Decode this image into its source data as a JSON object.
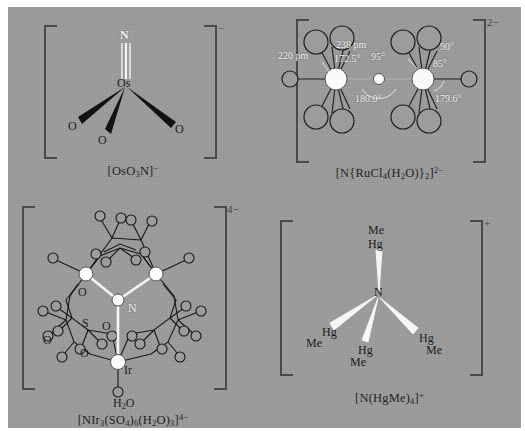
{
  "figure": {
    "background_color": "#9c9c9c",
    "bond_white_color": "#f5f5f5",
    "bond_black_color": "#141414",
    "bracket_color": "#4a4a4a"
  },
  "panels": [
    {
      "id": "osmium-nitride",
      "caption_parts": [
        "[OsO",
        "3",
        "N]",
        "−"
      ],
      "charge": "−",
      "center_label": "Os",
      "axial_label": "N",
      "ligand_labels": [
        "O",
        "O",
        "O"
      ],
      "bond_type_axial": "triple-white",
      "bond_type_equatorial": "black-wedge"
    },
    {
      "id": "ruthenium-nitrido-bridged",
      "caption_parts": [
        "[N",
        "{",
        "RuCl",
        "4",
        "(H",
        "2",
        "O)",
        "}",
        "2",
        "]",
        "2−"
      ],
      "charge": "2−",
      "metal_label": "Ru",
      "bridge_label": "N",
      "dimensions": [
        {
          "name": "ru-n-distance-left",
          "text": "220 pm"
        },
        {
          "name": "ru-cl-distance",
          "text": "238 pm"
        },
        {
          "name": "cl-ru-n-angle",
          "text": "172.5°"
        },
        {
          "name": "cl-ru-cl-angle-95",
          "text": "95°"
        },
        {
          "name": "cl-ru-cl-angle-90",
          "text": "90°"
        },
        {
          "name": "cl-ru-cl-angle-85",
          "text": "85°"
        },
        {
          "name": "ru-n-ru-angle",
          "text": "180.0°"
        },
        {
          "name": "cl-ru-oh2-angle",
          "text": "179.6°"
        }
      ]
    },
    {
      "id": "iridium-sulfato-cluster",
      "caption_parts": [
        "[NIr",
        "3",
        "(SO",
        "4",
        ")",
        "6",
        "(H",
        "2",
        "O)",
        "3",
        "]",
        "4−"
      ],
      "charge": "4−",
      "center_label": "N",
      "metal_label": "Ir",
      "ligand_labels": [
        "O",
        "S",
        "O",
        "O",
        "O"
      ],
      "water_label": "H2O",
      "water_label_parts": [
        "H",
        "2",
        "O"
      ]
    },
    {
      "id": "tetrakis-methylmercury-ammonium",
      "caption_parts": [
        "[N(HgMe)",
        "4",
        "]",
        "+"
      ],
      "charge": "+",
      "center_label": "N",
      "substituents": [
        {
          "name": "hgme-top",
          "upper": "Me",
          "lower": "Hg"
        },
        {
          "name": "hgme-left",
          "upper": "Hg",
          "lower": "Me"
        },
        {
          "name": "hgme-mid",
          "upper": "Hg",
          "lower": "Me"
        },
        {
          "name": "hgme-right",
          "upper": "Hg",
          "lower": "Me"
        }
      ]
    }
  ]
}
